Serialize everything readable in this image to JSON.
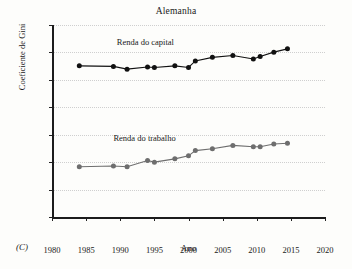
{
  "chart_data": {
    "type": "line",
    "title": "Alemanha",
    "xlabel": "Ano",
    "ylabel": "Coeficiente de Gini",
    "panel_label": "(C)",
    "xlim": [
      1980,
      2020
    ],
    "ylim": [
      0.3,
      1.0
    ],
    "xticks": [
      1980,
      1985,
      1990,
      1995,
      2000,
      2005,
      2010,
      2015,
      2020
    ],
    "yticks": [
      0.3,
      0.4,
      0.5,
      0.6,
      0.7,
      0.8,
      0.9,
      1.0
    ],
    "grid": true,
    "legend_position": "inline-labels",
    "series": [
      {
        "name": "Renda do capital",
        "color": "#111111",
        "marker": "circle",
        "label_x": 1989.5,
        "label_y": 0.935,
        "points": [
          {
            "x": 1984,
            "y": 0.851
          },
          {
            "x": 1989,
            "y": 0.849
          },
          {
            "x": 1991,
            "y": 0.839
          },
          {
            "x": 1994,
            "y": 0.847
          },
          {
            "x": 1995,
            "y": 0.845
          },
          {
            "x": 1998,
            "y": 0.851
          },
          {
            "x": 2000,
            "y": 0.845
          },
          {
            "x": 2001,
            "y": 0.869
          },
          {
            "x": 2003.5,
            "y": 0.882
          },
          {
            "x": 2006.5,
            "y": 0.889
          },
          {
            "x": 2009.5,
            "y": 0.876
          },
          {
            "x": 2010.5,
            "y": 0.885
          },
          {
            "x": 2012.5,
            "y": 0.901
          },
          {
            "x": 2014.5,
            "y": 0.913
          }
        ]
      },
      {
        "name": "Renda do trabalho",
        "color": "#6e6e6e",
        "marker": "circle",
        "label_x": 1989.0,
        "label_y": 0.585,
        "points": [
          {
            "x": 1984,
            "y": 0.483
          },
          {
            "x": 1989,
            "y": 0.486
          },
          {
            "x": 1991,
            "y": 0.483
          },
          {
            "x": 1994,
            "y": 0.506
          },
          {
            "x": 1995,
            "y": 0.5
          },
          {
            "x": 1998,
            "y": 0.512
          },
          {
            "x": 2000,
            "y": 0.523
          },
          {
            "x": 2001,
            "y": 0.542
          },
          {
            "x": 2003.5,
            "y": 0.549
          },
          {
            "x": 2006.5,
            "y": 0.561
          },
          {
            "x": 2009.5,
            "y": 0.556
          },
          {
            "x": 2010.5,
            "y": 0.556
          },
          {
            "x": 2012.5,
            "y": 0.566
          },
          {
            "x": 2014.5,
            "y": 0.569
          }
        ]
      }
    ]
  }
}
